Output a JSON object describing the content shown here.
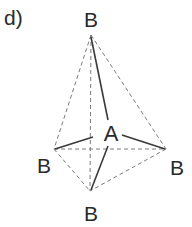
{
  "figure": {
    "panel_label": "d)",
    "central_atom": "A",
    "outer_atoms": [
      "B",
      "B",
      "B",
      "B"
    ],
    "geometry": "tetrahedral",
    "colors": {
      "line": "#3a3a3a",
      "dashed": "#7a7a7a",
      "text": "#2a2a2a"
    }
  }
}
